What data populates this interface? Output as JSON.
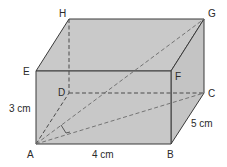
{
  "figure": {
    "type": "cuboid",
    "fill_color": "#c8c8c8",
    "edge_color": "#3a3a3a",
    "vertices": {
      "A": {
        "label": "A",
        "x": 36,
        "y": 144
      },
      "B": {
        "label": "B",
        "x": 171,
        "y": 144
      },
      "C": {
        "label": "C",
        "x": 204,
        "y": 93
      },
      "D": {
        "label": "D",
        "x": 69,
        "y": 93
      },
      "E": {
        "label": "E",
        "x": 36,
        "y": 71
      },
      "F": {
        "label": "F",
        "x": 171,
        "y": 71
      },
      "G": {
        "label": "G",
        "x": 204,
        "y": 19
      },
      "H": {
        "label": "H",
        "x": 69,
        "y": 19
      }
    },
    "dimensions": {
      "height": "3 cm",
      "length": "4 cm",
      "width": "5 cm"
    },
    "diagonals": [
      "AC",
      "AG"
    ],
    "right_angle_at": "between AC and CG projection"
  }
}
